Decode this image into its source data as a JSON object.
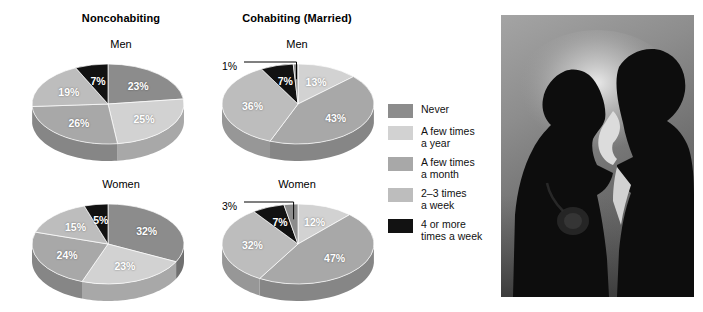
{
  "columns": [
    {
      "id": "noncohabiting",
      "title": "Noncohabiting"
    },
    {
      "id": "cohabiting",
      "title": "Cohabiting (Married)"
    }
  ],
  "rows": [
    {
      "id": "men",
      "title": "Men"
    },
    {
      "id": "women",
      "title": "Women"
    }
  ],
  "legend": {
    "items": [
      {
        "label": "Never",
        "color": "#8c8c8c"
      },
      {
        "label": "A few times\na year",
        "color": "#d2d2d2"
      },
      {
        "label": "A few times\na month",
        "color": "#a8a8a8"
      },
      {
        "label": "2–3 times\na week",
        "color": "#bdbdbd"
      },
      {
        "label": "4 or more\ntimes a week",
        "color": "#121212"
      }
    ]
  },
  "photo": {
    "alt": "silhouette-of-couple-kissing",
    "sky_top": "#9a9a9a",
    "sky_bottom": "#6e6e6e",
    "highlight": "#e6e6e6",
    "silhouette": "#0d0d0d"
  },
  "chart_data": [
    {
      "type": "pie",
      "id": "noncohabiting-men",
      "title": "Noncohabiting — Men",
      "categories": [
        "Never",
        "A few times a year",
        "A few times a month",
        "2–3 times a week",
        "4 or more times a week"
      ],
      "values": [
        23,
        25,
        26,
        19,
        7
      ],
      "labels": [
        "23%",
        "25%",
        "26%",
        "19%",
        "7%"
      ],
      "colors": [
        "#8c8c8c",
        "#d2d2d2",
        "#a8a8a8",
        "#bdbdbd",
        "#121212"
      ],
      "callouts": []
    },
    {
      "type": "pie",
      "id": "cohabiting-men",
      "title": "Cohabiting (Married) — Men",
      "categories": [
        "A few times a year",
        "Never",
        "A few times a month",
        "4 or more times a week",
        "2–3 times a week"
      ],
      "values": [
        13,
        43,
        36,
        7,
        1
      ],
      "labels": [
        "13%",
        "43%",
        "36%",
        "7%",
        "1%"
      ],
      "colors": [
        "#d2d2d2",
        "#a8a8a8",
        "#bdbdbd",
        "#121212",
        "#8c8c8c"
      ],
      "callouts": [
        {
          "label": "1%",
          "value": 1
        }
      ]
    },
    {
      "type": "pie",
      "id": "noncohabiting-women",
      "title": "Noncohabiting — Women",
      "categories": [
        "Never",
        "A few times a year",
        "A few times a month",
        "2–3 times a week",
        "4 or more times a week"
      ],
      "values": [
        32,
        23,
        24,
        15,
        5
      ],
      "labels": [
        "32%",
        "23%",
        "24%",
        "15%",
        "5%"
      ],
      "colors": [
        "#8c8c8c",
        "#d2d2d2",
        "#a8a8a8",
        "#bdbdbd",
        "#121212"
      ],
      "callouts": []
    },
    {
      "type": "pie",
      "id": "cohabiting-women",
      "title": "Cohabiting (Married) — Women",
      "categories": [
        "A few times a year",
        "Never",
        "A few times a month",
        "4 or more times a week",
        "2–3 times a week"
      ],
      "values": [
        12,
        47,
        32,
        7,
        3
      ],
      "labels": [
        "12%",
        "47%",
        "32%",
        "7%",
        "3%"
      ],
      "colors": [
        "#d2d2d2",
        "#a8a8a8",
        "#bdbdbd",
        "#121212",
        "#8c8c8c"
      ],
      "callouts": [
        {
          "label": "3%",
          "value": 3
        }
      ]
    }
  ]
}
